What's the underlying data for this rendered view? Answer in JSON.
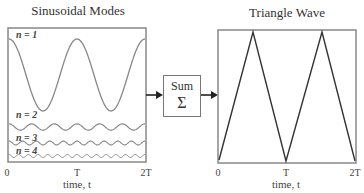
{
  "left_panel": {
    "title": "Sinusoidal Modes",
    "modes": [
      {
        "label": "n = 1"
      },
      {
        "label": "n = 2"
      },
      {
        "label": "n = 3"
      },
      {
        "label": "n = 4"
      }
    ],
    "x_ticks": [
      "0",
      "T",
      "2T"
    ],
    "x_label": "time, t"
  },
  "sum_block": {
    "label": "Sum",
    "symbol": "Σ"
  },
  "right_panel": {
    "title": "Triangle Wave",
    "x_ticks": [
      "0",
      "T",
      "2T"
    ],
    "x_label": "time, t"
  },
  "colors": {
    "frame": "#888888",
    "wave": "#888888",
    "triangle": "#333333",
    "arrow": "#222222"
  }
}
